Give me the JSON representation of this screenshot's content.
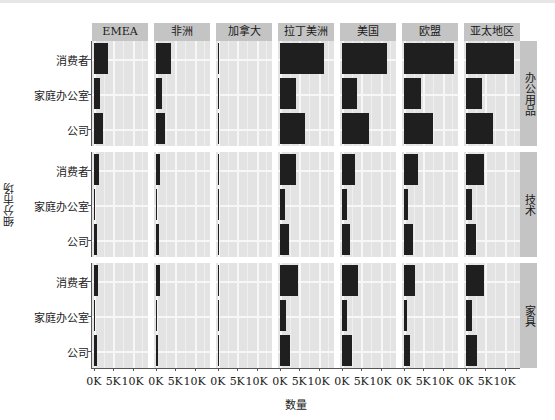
{
  "chart_data": {
    "type": "bar",
    "orientation": "horizontal",
    "facet": "grid",
    "title": "",
    "xlabel": "数量",
    "ylabel": "细分市场",
    "x_ticks": [
      "0K",
      "5K",
      "10K"
    ],
    "xlim": [
      -0.5,
      14
    ],
    "grid": true,
    "columns": [
      "EMEA",
      "非洲",
      "加拿大",
      "拉丁美洲",
      "美国",
      "欧盟",
      "亚太地区"
    ],
    "rows": [
      "办公用品",
      "技术",
      "家具"
    ],
    "categories": [
      "消费者",
      "家庭办公室",
      "公司"
    ],
    "unit": "K",
    "values": {
      "办公用品": {
        "EMEA": [
          3.7,
          1.7,
          2.4
        ],
        "非洲": [
          3.8,
          1.6,
          2.3
        ],
        "加拿大": [
          0.2,
          0.1,
          0.1
        ],
        "拉丁美洲": [
          11.4,
          4.1,
          6.6
        ],
        "美国": [
          11.8,
          4.0,
          7.0
        ],
        "欧盟": [
          12.9,
          4.4,
          7.6
        ],
        "亚太地区": [
          12.4,
          4.2,
          6.9
        ]
      },
      "技术": {
        "EMEA": [
          1.2,
          0.4,
          0.8
        ],
        "非洲": [
          1.1,
          0.4,
          0.7
        ],
        "加拿大": [
          0.1,
          0.0,
          0.0
        ],
        "拉丁美洲": [
          4.1,
          1.4,
          2.3
        ],
        "美国": [
          3.5,
          1.2,
          2.1
        ],
        "欧盟": [
          3.6,
          1.1,
          2.3
        ],
        "亚太地区": [
          4.7,
          1.7,
          2.6
        ]
      },
      "家具": {
        "EMEA": [
          1.1,
          0.4,
          0.7
        ],
        "非洲": [
          1.0,
          0.4,
          0.6
        ],
        "加拿大": [
          0.1,
          0.0,
          0.0
        ],
        "拉丁美洲": [
          4.6,
          1.6,
          2.7
        ],
        "美国": [
          4.1,
          1.4,
          2.5
        ],
        "欧盟": [
          2.9,
          0.9,
          1.7
        ],
        "亚太地区": [
          4.7,
          1.6,
          2.9
        ]
      }
    }
  },
  "labels": {
    "xlabel": "数量",
    "ylabel": "细分市场",
    "columns": [
      "EMEA",
      "非洲",
      "加拿大",
      "拉丁美洲",
      "美国",
      "欧盟",
      "亚太地区"
    ],
    "rows": [
      "办公用品",
      "技术",
      "家具"
    ],
    "categories": [
      "消费者",
      "家庭办公室",
      "公司"
    ],
    "x_ticks": [
      "0K",
      "5K",
      "10K"
    ]
  },
  "colors": {
    "bar": "#1f1f1f",
    "panel": "#e3e3e3",
    "strip": "#c4c4c4",
    "grid": "#f7f7f7"
  }
}
